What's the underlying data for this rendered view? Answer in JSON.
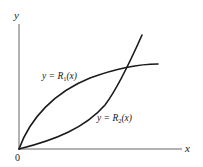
{
  "diagram": {
    "type": "function-graph",
    "axes": {
      "x_label": "x",
      "y_label": "y",
      "origin_label": "0"
    },
    "curves": [
      {
        "id": "R1",
        "label_prefix": "y = ",
        "label_fn": "R",
        "label_sub": "1",
        "label_arg": "(x)",
        "shape": "concave, rising from origin and leveling off"
      },
      {
        "id": "R2",
        "label_prefix": "y = ",
        "label_fn": "R",
        "label_sub": "2",
        "label_arg": "(x)",
        "shape": "convex, rising from origin and steepening"
      }
    ],
    "intersection": "curves meet at origin and cross again at upper right",
    "colors": {
      "background": "#ffffff",
      "ink": "#1a1a1a",
      "axis": "#555555"
    }
  }
}
